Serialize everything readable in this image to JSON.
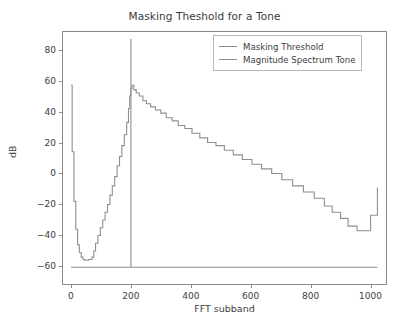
{
  "chart_data": {
    "type": "line",
    "title": "Masking Theshold for a Tone",
    "xlabel": "FFT subband",
    "ylabel": "dB",
    "xlim": [
      -30,
      1055
    ],
    "ylim": [
      -72,
      92
    ],
    "xticks": [
      0,
      200,
      400,
      600,
      800,
      1000
    ],
    "yticks": [
      80,
      60,
      40,
      20,
      0,
      -20,
      -40,
      -60
    ],
    "xticklabels": [
      "0",
      "200",
      "400",
      "600",
      "800",
      "1000"
    ],
    "yticklabels": [
      "80",
      "60",
      "40",
      "20",
      "0",
      "−20",
      "−40",
      "−60"
    ],
    "grid": false,
    "legend_position": "upper right",
    "series": [
      {
        "name": "Masking Threshold",
        "color": "#8f8f8f",
        "style": "step",
        "x": [
          0,
          4,
          10,
          16,
          22,
          28,
          34,
          40,
          46,
          52,
          58,
          64,
          70,
          76,
          82,
          90,
          98,
          106,
          114,
          122,
          130,
          138,
          146,
          154,
          162,
          170,
          178,
          186,
          192,
          196,
          200,
          204,
          210,
          218,
          228,
          240,
          252,
          266,
          282,
          300,
          318,
          338,
          358,
          380,
          404,
          430,
          456,
          484,
          512,
          542,
          572,
          604,
          636,
          670,
          704,
          740,
          776,
          812,
          846,
          872,
          900,
          925,
          955,
          985,
          1000,
          1023
        ],
        "y": [
          57,
          14,
          -18,
          -36,
          -46,
          -51,
          -54,
          -55.5,
          -56,
          -56,
          -55.5,
          -55.5,
          -54,
          -50,
          -45,
          -40,
          -35,
          -30,
          -25,
          -20,
          -14,
          -8,
          -2,
          5,
          11,
          18,
          25,
          33,
          42,
          50,
          55,
          57,
          54,
          52,
          50,
          47,
          45,
          43,
          41,
          39,
          36,
          34,
          31,
          29,
          26,
          23,
          20,
          18,
          15,
          12,
          9,
          6,
          3,
          0,
          -4,
          -8,
          -12,
          -16,
          -21,
          -25,
          -29,
          -34,
          -37,
          -37,
          -27,
          -9
        ]
      },
      {
        "name": "Magnitude Spectrum Tone",
        "color": "#8f8f8f",
        "style": "line",
        "x": [
          0,
          198,
          200,
          200,
          200,
          202,
          1023
        ],
        "y": [
          -60.5,
          -60.5,
          -60.5,
          87,
          -60.5,
          -60.5,
          -60.5
        ]
      }
    ]
  },
  "legend": {
    "entries": [
      {
        "label": "Masking Threshold"
      },
      {
        "label": "Magnitude Spectrum Tone"
      }
    ]
  }
}
